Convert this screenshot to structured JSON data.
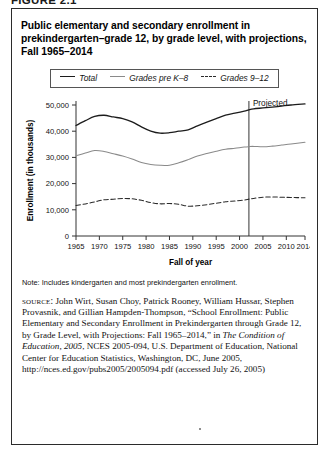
{
  "figure": {
    "label": "FIGURE 2.1",
    "title": "Public elementary and secondary enrollment in prekindergarten–grade 12, by grade level, with projections, Fall 1965–2014"
  },
  "note": {
    "text": "Note: Includes kindergarten and most prekindergarten enrollment."
  },
  "source": {
    "kicker": "source:",
    "body_part1": " John Wirt, Susan Choy, Patrick Rooney, William Hussar, Stephen Provasnik, and Gillian Hampden-Thompson, “School Enrollment: Public Elementary and Secondary Enrollment in Prekindergarten through Grade 12, by Grade Level, with Projections: Fall 1965–2014,” in ",
    "italic_title": "The Condition of Education, 2005",
    "body_part2": ", NCES 2005-094, U.S. Department of Education, National Center for Education Statistics, Washington, DC, June 2005, http://nces.ed.gov/pubs2005/2005094.pdf (accessed July 26, 2005)"
  },
  "chart_data": {
    "type": "line",
    "title": "Public elementary and secondary enrollment in prekindergarten–grade 12, by grade level, with projections, Fall 1965–2014",
    "xlabel": "Fall of year",
    "ylabel": "Enrollment (in thousands)",
    "xlim": [
      1965,
      2014
    ],
    "ylim": [
      0,
      50000
    ],
    "grid": false,
    "legend_position": "top-center",
    "xticks": [
      1965,
      1970,
      1975,
      1980,
      1985,
      1990,
      1995,
      2000,
      2005,
      2010,
      2014
    ],
    "xtick_labels": [
      "1965",
      "1970",
      "1975",
      "1980",
      "1985",
      "1990",
      "1995",
      "2000",
      "2005",
      "2010",
      "2014"
    ],
    "yticks": [
      0,
      10000,
      20000,
      30000,
      40000,
      50000
    ],
    "ytick_labels": [
      "0",
      "10,000",
      "20,000",
      "30,000",
      "40,000",
      "50,000"
    ],
    "annotations": [
      {
        "text": "Projected",
        "x": 2002,
        "note": "vertical divider line marking start of projected data"
      }
    ],
    "x": [
      1965,
      1967,
      1969,
      1971,
      1973,
      1975,
      1977,
      1979,
      1981,
      1983,
      1985,
      1987,
      1989,
      1991,
      1993,
      1995,
      1997,
      1999,
      2001,
      2002,
      2003,
      2005,
      2007,
      2009,
      2011,
      2014
    ],
    "series": [
      {
        "name": "Total",
        "style": "solid",
        "color": "#1c1c1c",
        "values": [
          42173,
          44002,
          45619,
          46081,
          45429,
          44819,
          43577,
          41651,
          40044,
          39252,
          39422,
          40008,
          40543,
          42047,
          43465,
          44840,
          46127,
          46857,
          47672,
          48183,
          48540,
          48871,
          49200,
          49600,
          50000,
          50400
        ]
      },
      {
        "name": "Grades pre K–8",
        "style": "solid",
        "color": "#8a8a8a",
        "values": [
          30563,
          31641,
          32597,
          32265,
          31401,
          30515,
          29375,
          28034,
          27280,
          26981,
          27034,
          27933,
          29152,
          30506,
          31504,
          32341,
          33073,
          33486,
          33952,
          34115,
          34200,
          34050,
          34300,
          34700,
          35100,
          35800
        ]
      },
      {
        "name": "Grades 9–12",
        "style": "dashed",
        "color": "#2b2b2b",
        "values": [
          11610,
          12250,
          13022,
          13816,
          14028,
          14304,
          14202,
          13617,
          12764,
          12271,
          12388,
          12075,
          11391,
          11541,
          11961,
          12499,
          13054,
          13371,
          13720,
          14068,
          14340,
          14821,
          14900,
          14800,
          14700,
          14600
        ]
      }
    ]
  },
  "legend": {
    "items": [
      {
        "label": "Total",
        "style": "solid",
        "color": "#1c1c1c"
      },
      {
        "label": "Grades pre K–8",
        "style": "solid",
        "color": "#8a8a8a"
      },
      {
        "label": "Grades 9–12",
        "style": "dashed",
        "color": "#2b2b2b"
      }
    ]
  }
}
